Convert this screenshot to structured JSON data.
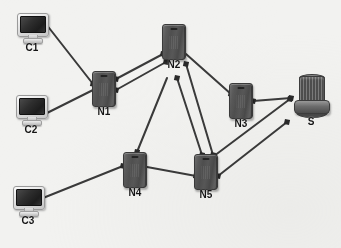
{
  "figure": {
    "type": "network-topology-diagram",
    "background_color": "#f2f2f0",
    "width": 341,
    "height": 248
  },
  "nodes": [
    {
      "id": "C1",
      "label": "C1",
      "kind": "client",
      "icon": "computer-monitor-icon",
      "x": 32,
      "y": 28
    },
    {
      "id": "C2",
      "label": "C2",
      "kind": "client",
      "icon": "computer-monitor-icon",
      "x": 31,
      "y": 110
    },
    {
      "id": "C3",
      "label": "C3",
      "kind": "client",
      "icon": "computer-monitor-icon",
      "x": 28,
      "y": 201
    },
    {
      "id": "N1",
      "label": "N1",
      "kind": "router",
      "icon": "router-box-icon",
      "x": 104,
      "y": 89
    },
    {
      "id": "N2",
      "label": "N2",
      "kind": "router",
      "icon": "router-box-icon",
      "x": 174,
      "y": 42
    },
    {
      "id": "N3",
      "label": "N3",
      "kind": "router",
      "icon": "router-box-icon",
      "x": 241,
      "y": 101
    },
    {
      "id": "N4",
      "label": "N4",
      "kind": "router",
      "icon": "router-box-icon",
      "x": 135,
      "y": 170
    },
    {
      "id": "N5",
      "label": "N5",
      "kind": "router",
      "icon": "router-box-icon",
      "x": 206,
      "y": 172
    },
    {
      "id": "S",
      "label": "S",
      "kind": "server",
      "icon": "server-stack-icon",
      "x": 311,
      "y": 98
    }
  ],
  "links": [
    {
      "from": "C1",
      "to": "N1",
      "x1": 46,
      "y1": 24,
      "x2": 93,
      "y2": 84,
      "arrow": "end"
    },
    {
      "from": "C2",
      "to": "N1",
      "x1": 45,
      "y1": 114,
      "x2": 93,
      "y2": 90,
      "arrow": "start"
    },
    {
      "from": "N1",
      "to": "N2",
      "x1": 116,
      "y1": 79,
      "x2": 163,
      "y2": 54,
      "arrow": "both"
    },
    {
      "from": "N1",
      "to": "N2",
      "x1": 116,
      "y1": 90,
      "x2": 166,
      "y2": 62,
      "arrow": "both"
    },
    {
      "from": "N2",
      "to": "N3",
      "x1": 186,
      "y1": 54,
      "x2": 231,
      "y2": 94,
      "arrow": "end"
    },
    {
      "from": "N2",
      "to": "N4",
      "x1": 167,
      "y1": 78,
      "x2": 137,
      "y2": 152,
      "arrow": "end"
    },
    {
      "from": "N2",
      "to": "N5",
      "x1": 177,
      "y1": 78,
      "x2": 202,
      "y2": 155,
      "arrow": "both"
    },
    {
      "from": "N2",
      "to": "N5",
      "x1": 186,
      "y1": 64,
      "x2": 213,
      "y2": 155,
      "arrow": "both"
    },
    {
      "from": "N3",
      "to": "S",
      "x1": 253,
      "y1": 101,
      "x2": 291,
      "y2": 98,
      "arrow": "both"
    },
    {
      "from": "N5",
      "to": "S",
      "x1": 214,
      "y1": 156,
      "x2": 290,
      "y2": 99,
      "arrow": "both"
    },
    {
      "from": "N5",
      "to": "S",
      "x1": 218,
      "y1": 176,
      "x2": 287,
      "y2": 122,
      "arrow": "both"
    },
    {
      "from": "C3",
      "to": "N4",
      "x1": 43,
      "y1": 198,
      "x2": 123,
      "y2": 166,
      "arrow": "end"
    },
    {
      "from": "N4",
      "to": "N5",
      "x1": 147,
      "y1": 167,
      "x2": 196,
      "y2": 176,
      "arrow": "end"
    }
  ],
  "style": {
    "link_color": "#3a3a3a",
    "link_width": 2,
    "arrow_color": "#2a2a2a",
    "label_color": "#141414"
  }
}
